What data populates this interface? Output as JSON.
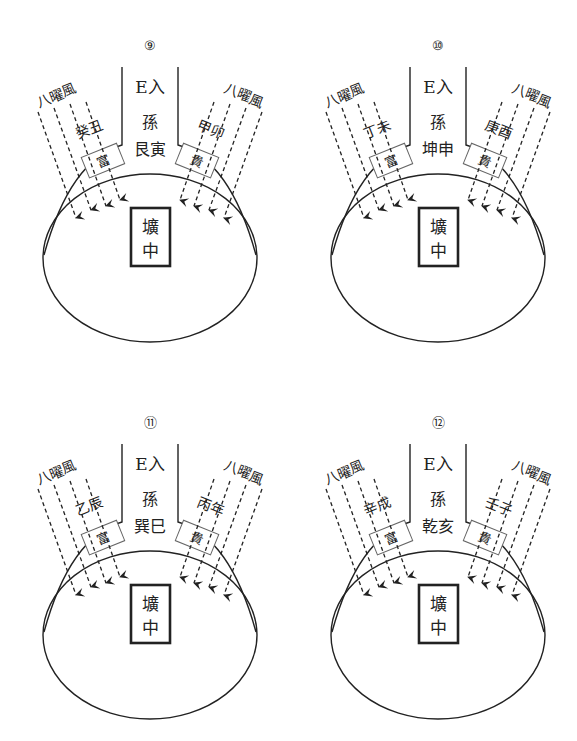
{
  "diagrams": [
    {
      "number": "⑨",
      "entry_label": "E入",
      "sun_label": "孫",
      "direction_label": "艮寅",
      "left_wind_label": "八曜風",
      "left_stem_label": "癸丑",
      "left_box_label": "富",
      "right_wind_label": "八曜風",
      "right_stem_label": "甲卯",
      "right_box_label": "貴",
      "center_label_top": "壙",
      "center_label_bottom": "中"
    },
    {
      "number": "⑩",
      "entry_label": "E入",
      "sun_label": "孫",
      "direction_label": "坤申",
      "left_wind_label": "八曜風",
      "left_stem_label": "丁未",
      "left_box_label": "富",
      "right_wind_label": "八曜風",
      "right_stem_label": "庚酉",
      "right_box_label": "貴",
      "center_label_top": "壙",
      "center_label_bottom": "中"
    },
    {
      "number": "⑪",
      "entry_label": "E入",
      "sun_label": "孫",
      "direction_label": "巽巳",
      "left_wind_label": "八曜風",
      "left_stem_label": "乙辰",
      "left_box_label": "富",
      "right_wind_label": "八曜風",
      "right_stem_label": "丙年",
      "right_box_label": "貴",
      "center_label_top": "壙",
      "center_label_bottom": "中"
    },
    {
      "number": "⑫",
      "entry_label": "E入",
      "sun_label": "孫",
      "direction_label": "乾亥",
      "left_wind_label": "八曜風",
      "left_stem_label": "辛戌",
      "left_box_label": "富",
      "right_wind_label": "八曜風",
      "right_stem_label": "壬子",
      "right_box_label": "貴",
      "center_label_top": "壙",
      "center_label_bottom": "中"
    }
  ],
  "colors": {
    "line": "#222222",
    "box_stroke": "#555555",
    "background": "#ffffff"
  }
}
